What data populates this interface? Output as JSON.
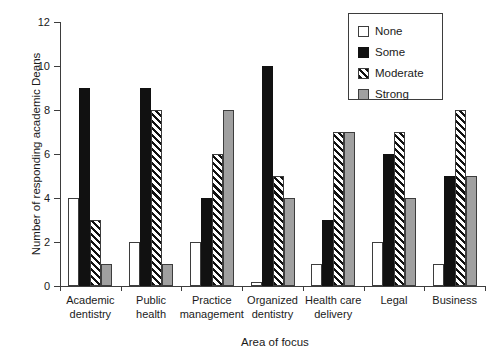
{
  "chart_data": {
    "type": "bar",
    "title": "",
    "xlabel": "Area of focus",
    "ylabel": "Number of responding academic Deans",
    "ylim": [
      0,
      12
    ],
    "yticks": [
      0,
      2,
      4,
      6,
      8,
      10,
      12
    ],
    "ytick_labels": [
      "0",
      "2",
      "4",
      "6",
      "8",
      "10",
      "12"
    ],
    "grid": false,
    "legend_position": "top-right",
    "categories": [
      "Academic dentistry",
      "Public health",
      "Practice management",
      "Organized dentistry",
      "Health care delivery",
      "Legal",
      "Business"
    ],
    "category_lines": [
      [
        "Academic",
        "dentistry"
      ],
      [
        "Public",
        "health"
      ],
      [
        "Practice",
        "management"
      ],
      [
        "Organized",
        "dentistry"
      ],
      [
        "Health care",
        "delivery"
      ],
      [
        "Legal",
        ""
      ],
      [
        "Business",
        ""
      ]
    ],
    "series": [
      {
        "name": "None",
        "fill": "white",
        "color": "#ffffff",
        "values": [
          4,
          2,
          2,
          0.2,
          1,
          2,
          1
        ]
      },
      {
        "name": "Some",
        "fill": "black",
        "color": "#111111",
        "values": [
          9,
          9,
          4,
          10,
          3,
          6,
          5
        ]
      },
      {
        "name": "Moderate",
        "fill": "diagonal-hatch",
        "color": "#111111",
        "values": [
          3,
          8,
          6,
          5,
          7,
          7,
          8
        ]
      },
      {
        "name": "Strong",
        "fill": "gray",
        "color": "#a0a0a0",
        "values": [
          1,
          1,
          8,
          4,
          7,
          4,
          5
        ]
      }
    ]
  },
  "legend": {
    "items": [
      {
        "label": "None"
      },
      {
        "label": "Some"
      },
      {
        "label": "Moderate"
      },
      {
        "label": "Strong"
      }
    ]
  }
}
